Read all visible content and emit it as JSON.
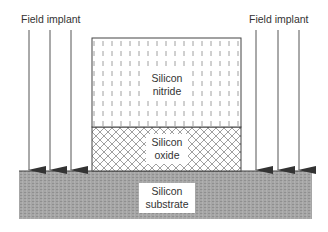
{
  "diagram": {
    "labels": {
      "field_implant_left": "Field implant",
      "field_implant_right": "Field implant",
      "nitride_line1": "Silicon",
      "nitride_line2": "nitride",
      "oxide_line1": "Silicon",
      "oxide_line2": "oxide",
      "substrate_line1": "Silicon",
      "substrate_line2": "substrate"
    },
    "layers": [
      {
        "name": "Silicon nitride",
        "pattern": "vertical-dashes"
      },
      {
        "name": "Silicon oxide",
        "pattern": "crosshatch"
      },
      {
        "name": "Silicon substrate",
        "pattern": "gray-stipple"
      }
    ],
    "arrows": {
      "left_count": 3,
      "right_count": 3,
      "direction": "down"
    },
    "colors": {
      "line": "#333333",
      "substrate_fill": "#a9a9a9",
      "hatch": "#777777"
    }
  }
}
